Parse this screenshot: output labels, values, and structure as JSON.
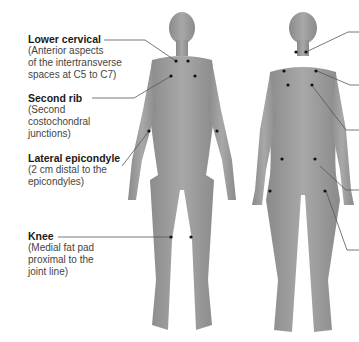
{
  "labels": [
    {
      "title": "Lower cervical",
      "desc": [
        "(Anterior aspects",
        "of the intertransverse",
        "spaces at C5 to C7)"
      ]
    },
    {
      "title": "Second rib",
      "desc": [
        "(Second",
        "costochondral",
        "junctions)"
      ]
    },
    {
      "title": "Lateral epicondyle",
      "desc": [
        "(2 cm distal to the",
        "epicondyles)"
      ]
    },
    {
      "title": "Knee",
      "desc": [
        "(Medial fat pad",
        "proximal to the",
        "joint line)"
      ]
    }
  ],
  "colors": {
    "skin": "#9a9a9a",
    "dot": "#111111",
    "line": "#555555",
    "text": "#1a1a1a"
  }
}
